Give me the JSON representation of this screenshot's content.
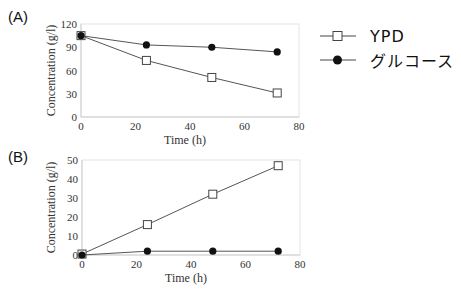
{
  "panels": {
    "a": {
      "label": "(A)"
    },
    "b": {
      "label": "(B)"
    }
  },
  "legend": {
    "items": [
      {
        "label": "YPD",
        "marker": "open-square"
      },
      {
        "label": "グルコース",
        "marker": "filled-circle"
      }
    ]
  },
  "chart_data": [
    {
      "type": "line",
      "title": "(A)",
      "xlabel": "Time (h)",
      "ylabel": "Concentration (g/l)",
      "xlim": [
        0,
        80
      ],
      "ylim": [
        0,
        120
      ],
      "xticks": [
        0,
        20,
        40,
        60,
        80
      ],
      "yticks": [
        0,
        30,
        60,
        90,
        120
      ],
      "x": [
        0,
        24,
        48,
        72
      ],
      "series": [
        {
          "name": "YPD",
          "marker": "open-square",
          "values": [
            105,
            73,
            51,
            31
          ]
        },
        {
          "name": "グルコース",
          "marker": "filled-circle",
          "values": [
            105,
            93,
            90,
            84
          ]
        }
      ],
      "grid": false,
      "legend_position": "right"
    },
    {
      "type": "line",
      "title": "(B)",
      "xlabel": "Time (h)",
      "ylabel": "Concentration (g/l)",
      "xlim": [
        0,
        80
      ],
      "ylim": [
        0,
        50
      ],
      "xticks": [
        0,
        20,
        40,
        60,
        80
      ],
      "yticks": [
        0,
        10,
        20,
        30,
        40,
        50
      ],
      "x": [
        0,
        24,
        48,
        72
      ],
      "series": [
        {
          "name": "YPD",
          "marker": "open-square",
          "values": [
            0.5,
            16,
            32,
            47
          ]
        },
        {
          "name": "グルコース",
          "marker": "filled-circle",
          "values": [
            0,
            2,
            2,
            2
          ]
        }
      ],
      "grid": false,
      "legend_position": "right"
    }
  ]
}
